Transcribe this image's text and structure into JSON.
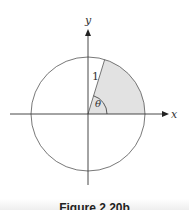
{
  "figure": {
    "caption": "Figure 2.20b",
    "labels": {
      "x_axis": "x",
      "y_axis": "y",
      "radius": "1",
      "angle": "θ"
    },
    "colors": {
      "line": "#444444",
      "shade": "#e2e2e2",
      "background": "#ffffff"
    },
    "geometry": {
      "center": [
        88,
        114
      ],
      "radius": 57,
      "sector_from_deg": 0,
      "sector_to_deg": 73
    }
  }
}
